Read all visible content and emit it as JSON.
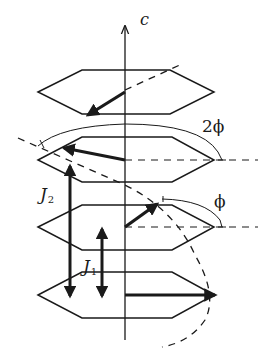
{
  "diagram": {
    "colors": {
      "line": "#1a1a1a",
      "background": "#ffffff"
    },
    "labels": {
      "axis": "c",
      "angle_double": "2ϕ",
      "angle_single": "ϕ",
      "j2_main": "J",
      "j2_sub": "2",
      "j1_main": "J",
      "j1_sub": "1"
    },
    "layers": [
      {
        "index": 1,
        "position": "top",
        "spin_direction": "down-left"
      },
      {
        "index": 2,
        "position": "second",
        "spin_direction": "left (rotated 2ϕ from reference)"
      },
      {
        "index": 3,
        "position": "third",
        "spin_direction": "up-right (rotated ϕ from reference)"
      },
      {
        "index": 4,
        "position": "bottom",
        "spin_direction": "right (reference)"
      }
    ],
    "couplings": [
      {
        "name": "J1",
        "spans": "adjacent layers (3 to 4)"
      },
      {
        "name": "J2",
        "spans": "next-nearest layers (2 to 4)"
      }
    ]
  }
}
